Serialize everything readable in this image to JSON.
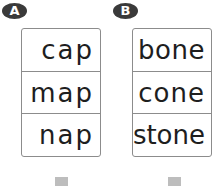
{
  "groups": [
    {
      "label": "A",
      "words": [
        "cap",
        "map",
        "nap"
      ]
    },
    {
      "label": "B",
      "words": [
        "bone",
        "cone",
        "stone"
      ]
    }
  ]
}
